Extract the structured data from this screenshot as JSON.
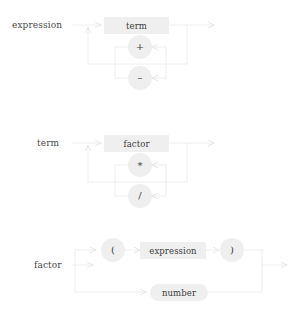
{
  "figure": {
    "type": "railroad-syntax-diagram",
    "background_color": "#ffffff",
    "line_color": "#ebebeb",
    "box_fill_color": "#efefef",
    "circle_fill_color": "#efefef",
    "text_color": "#3d3d3d",
    "label_color": "#4a4a4a",
    "caption": ""
  },
  "diagrams": [
    {
      "id": "expression",
      "label": "expression",
      "main_node": "term",
      "alternatives": [
        "+",
        "-"
      ]
    },
    {
      "id": "term",
      "label": "term",
      "main_node": "factor",
      "alternatives": [
        "*",
        "/"
      ]
    },
    {
      "id": "factor",
      "label": "factor",
      "branch_top": [
        "(",
        "expression",
        ")"
      ],
      "branch_bottom": [
        "number"
      ]
    }
  ],
  "nodes": {
    "d1_term": "term",
    "d1_plus": "+",
    "d1_minus": "–",
    "d2_factor": "factor",
    "d2_star": "*",
    "d2_slash": "/",
    "d3_lparen": "(",
    "d3_expression": "expression",
    "d3_rparen": ")",
    "d3_number": "number"
  },
  "labels": {
    "d1": "expression",
    "d2": "term",
    "d3": "factor"
  }
}
